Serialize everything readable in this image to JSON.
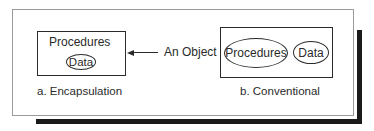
{
  "diagram": {
    "encapsulation": {
      "outer_label": "Procedures",
      "inner_label": "Data",
      "caption": "a.  Encapsulation"
    },
    "pointer": {
      "label": "An Object",
      "direction": "left"
    },
    "conventional": {
      "items": [
        "Procedures",
        "Data"
      ],
      "caption": "b. Conventional"
    }
  },
  "colors": {
    "stroke": "#2a2a2a",
    "frame": "#9a9a9a",
    "shadow": "#1a1a1a",
    "background": "#ffffff"
  }
}
